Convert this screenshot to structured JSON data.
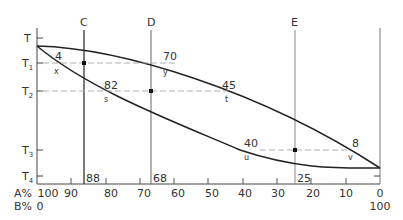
{
  "diagram": {
    "type": "binary phase diagram",
    "y_labels": [
      {
        "base": "T",
        "sub": "",
        "y": 38
      },
      {
        "base": "T",
        "sub": "1",
        "y": 63
      },
      {
        "base": "T",
        "sub": "2",
        "y": 91
      },
      {
        "base": "T",
        "sub": "3",
        "y": 150
      },
      {
        "base": "T",
        "sub": "4",
        "y": 176
      }
    ],
    "x_axis": {
      "a_label": "A%",
      "b_label": "B%",
      "a_ticks": [
        "100",
        "90",
        "80",
        "70",
        "60",
        "50",
        "40",
        "30",
        "20",
        "10",
        "0"
      ],
      "b_start": "0",
      "b_end": "100"
    },
    "verticals": [
      {
        "label": "C",
        "bottom_value": "88",
        "x": 84
      },
      {
        "label": "D",
        "bottom_value": "68",
        "x": 151
      },
      {
        "label": "E",
        "bottom_value": "25",
        "x": 295
      }
    ],
    "tie_lines": [
      {
        "temp": "T1",
        "left_value": "4",
        "left_point": "x",
        "right_value": "70",
        "right_point": "y"
      },
      {
        "temp": "T2",
        "left_value": "82",
        "left_point": "s",
        "right_value": "45",
        "right_point": "t"
      },
      {
        "temp": "T3",
        "left_value": "40",
        "left_point": "u",
        "right_value": "8",
        "right_point": "v"
      }
    ]
  }
}
